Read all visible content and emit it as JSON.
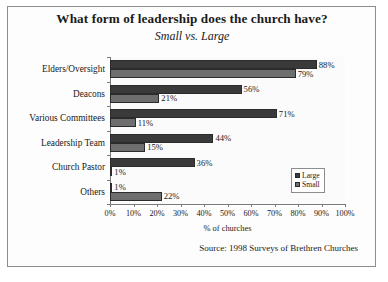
{
  "chart_data": {
    "type": "bar",
    "orientation": "horizontal",
    "title": "What form of leadership does the church have?",
    "subtitle": "Small vs. Large",
    "xlabel": "% of churches",
    "ylabel": "",
    "xlim": [
      0,
      100
    ],
    "grid": false,
    "legend_position": "inside-bottom-right",
    "source": "Source: 1998 Surveys of Brethren Churches",
    "categories": [
      "Elders/Oversight",
      "Deacons",
      "Various Committees",
      "Leadership Team",
      "Church Pastor",
      "Others"
    ],
    "xticks": [
      "0%",
      "10%",
      "20%",
      "30%",
      "40%",
      "50%",
      "60%",
      "70%",
      "80%",
      "90%",
      "100%"
    ],
    "xtick_values": [
      0,
      10,
      20,
      30,
      40,
      50,
      60,
      70,
      80,
      90,
      100
    ],
    "series": [
      {
        "name": "Large",
        "color": "#3a3a3a",
        "values": [
          88,
          56,
          71,
          44,
          36,
          1
        ],
        "labels": [
          "88%",
          "56%",
          "71%",
          "44%",
          "36%",
          "1%"
        ]
      },
      {
        "name": "Small",
        "color": "#6e6e6e",
        "values": [
          79,
          21,
          11,
          15,
          1,
          22
        ],
        "labels": [
          "79%",
          "21%",
          "11%",
          "15%",
          "1%",
          "22%"
        ]
      }
    ]
  }
}
